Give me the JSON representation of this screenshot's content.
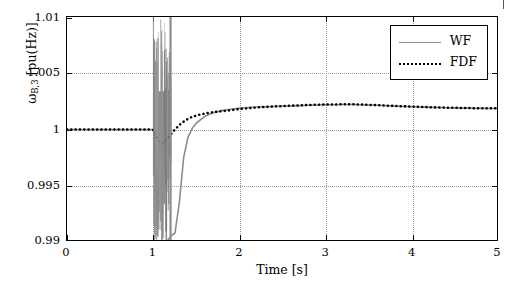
{
  "chart_data": {
    "type": "line",
    "title": "",
    "xlabel": "Time [s]",
    "ylabel_html": "ω_{B,3} [pu(Hz)]",
    "xlim": [
      0,
      5
    ],
    "ylim": [
      0.99,
      1.01
    ],
    "xticks": [
      0,
      1,
      2,
      3,
      4,
      5
    ],
    "xtick_labels": [
      "0",
      "1",
      "2",
      "3",
      "4",
      "5"
    ],
    "yticks": [
      0.99,
      0.995,
      1,
      1.005,
      1.01
    ],
    "ytick_labels": [
      "0.99",
      "0.995",
      "1",
      "1.005",
      "1.01"
    ],
    "grid": true,
    "legend_position": "top-right",
    "series": [
      {
        "name": "WF",
        "color": "#8c8c8c",
        "style": "solid",
        "x": [
          0,
          0.2,
          0.4,
          0.6,
          0.8,
          0.95,
          1.0,
          1.02,
          1.05,
          1.08,
          1.1,
          1.12,
          1.15,
          1.18,
          1.2,
          1.25,
          1.3,
          1.35,
          1.4,
          1.45,
          1.5,
          1.6,
          1.7,
          1.8,
          1.9,
          2.0,
          2.2,
          2.4,
          2.6,
          2.8,
          3.0,
          3.2,
          3.3,
          3.4,
          3.6,
          3.8,
          4.0,
          4.2,
          4.4,
          4.6,
          4.8,
          5.0
        ],
        "y": [
          1.0,
          1.0,
          1.0,
          1.0,
          1.0,
          1.0,
          1.0,
          0.9995,
          0.9905,
          1.0098,
          0.9902,
          1.0095,
          0.99,
          0.9903,
          0.9905,
          0.9908,
          0.9935,
          0.9975,
          0.9993,
          1.0001,
          1.0006,
          1.0012,
          1.0015,
          1.0017,
          1.0018,
          1.0019,
          1.002,
          1.00205,
          1.0021,
          1.00215,
          1.0022,
          1.00222,
          1.00222,
          1.0022,
          1.00215,
          1.00208,
          1.00202,
          1.00197,
          1.00193,
          1.0019,
          1.00188,
          1.00187
        ]
      },
      {
        "name": "FDF",
        "color": "#000000",
        "style": "dotted",
        "x": [
          0,
          0.2,
          0.4,
          0.6,
          0.8,
          0.95,
          1.0,
          1.02,
          1.05,
          1.08,
          1.1,
          1.12,
          1.15,
          1.2,
          1.25,
          1.3,
          1.35,
          1.4,
          1.45,
          1.5,
          1.6,
          1.7,
          1.8,
          1.9,
          2.0,
          2.2,
          2.4,
          2.6,
          2.8,
          3.0,
          3.2,
          3.3,
          3.4,
          3.6,
          3.8,
          4.0,
          4.2,
          4.4,
          4.6,
          4.8,
          5.0
        ],
        "y": [
          1.0,
          1.0,
          1.0,
          1.0,
          1.0,
          1.0,
          0.99995,
          0.9996,
          0.9991,
          0.99885,
          0.99878,
          0.99885,
          0.9991,
          0.99955,
          1.0,
          1.0004,
          1.0007,
          1.00095,
          1.00112,
          1.00125,
          1.00143,
          1.00155,
          1.00163,
          1.00172,
          1.00182,
          1.00196,
          1.00205,
          1.00212,
          1.00218,
          1.00222,
          1.00224,
          1.00224,
          1.00222,
          1.00216,
          1.00209,
          1.00203,
          1.00198,
          1.00194,
          1.00191,
          1.00189,
          1.00188
        ]
      }
    ],
    "disturbance_band": {
      "x_start": 1.0,
      "x_end": 1.21,
      "description": "dense gray oscillation band saturating plot vertically"
    }
  },
  "legend": {
    "items": [
      {
        "label": "WF",
        "style": "solid",
        "color": "#8c8c8c"
      },
      {
        "label": "FDF",
        "style": "dotted",
        "color": "#000000"
      }
    ]
  },
  "axes": {
    "xlabel": "Time [s]",
    "ylabel_main": "ω",
    "ylabel_sub": "B,3",
    "ylabel_unit": " [pu(Hz)]"
  },
  "colors": {
    "wf": "#8c8c8c",
    "fdf": "#000000",
    "grid": "#9a9a9a",
    "axis": "#000000",
    "background": "#ffffff"
  }
}
